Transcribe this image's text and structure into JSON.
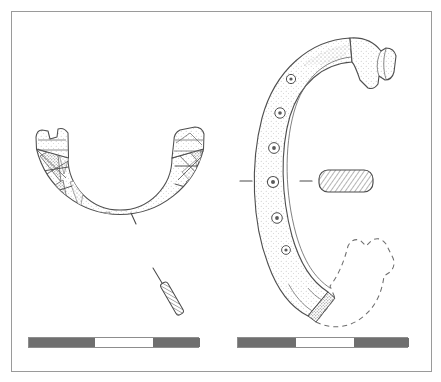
{
  "figure": {
    "domain_kind": "archaeological-line-drawing",
    "title": "Decorated penannular bracelet — plan and profile views",
    "background_color": "#ffffff",
    "frame": {
      "border_color": "#9a9a9a",
      "x": 11,
      "y": 11,
      "width": 421,
      "height": 361
    },
    "ink_color": "#555555",
    "stipple_color": "#6a6a6a",
    "views": [
      {
        "id": "view-plan",
        "name": "plan-view",
        "label": "Plan view of penannular bracelet",
        "description": "U-shaped open bracelet seen from above, with panelled stippled triangular decoration and broken terminals",
        "center_x": 120,
        "center_y": 215,
        "outer_radius": 86,
        "inner_radius": 52,
        "open_gap_deg": 150,
        "panel_count": 13
      },
      {
        "id": "view-profile",
        "name": "profile-view",
        "label": "Profile view of penannular bracelet",
        "description": "C-shaped side view with ring-and-dot bosses along the band, flared upper terminal and dashed reconstruction of the lost lower terminal",
        "center_x": 330,
        "center_y": 178,
        "outer_radius": 150,
        "inner_radius": 112,
        "boss_count": 5
      }
    ],
    "annotations": [
      {
        "id": "section-line-plan",
        "name": "section-line-plan",
        "label": "Section indicator line on plan view",
        "kind": "leader-tick"
      },
      {
        "id": "section-profile-small",
        "name": "section-profile-small",
        "label": "Hatched narrow bar section of band (plan view)",
        "kind": "hatched-section"
      },
      {
        "id": "section-line-profile",
        "name": "section-line-profile",
        "label": "Section line tick marks across profile view",
        "kind": "section-tick-pair"
      },
      {
        "id": "section-rect",
        "name": "cross-section-rectangle",
        "label": "Hatched rounded-rectangle cross-section of band",
        "kind": "hatched-section"
      },
      {
        "id": "reconstruction-dashed",
        "name": "reconstruction-outline",
        "label": "Dashed reconstruction of missing terminal",
        "kind": "dashed-outline"
      }
    ],
    "scalebars": [
      {
        "id": "scalebar-left",
        "name": "scale-bar-plan",
        "label": "Scale bar for plan view",
        "segments": [
          {
            "tone": "dark",
            "width_px": 66
          },
          {
            "tone": "light",
            "width_px": 58
          },
          {
            "tone": "dark",
            "width_px": 47
          }
        ],
        "dark_color": "#6f6f6f",
        "light_color": "#ffffff",
        "border_color": "#8d8d8d"
      },
      {
        "id": "scalebar-right",
        "name": "scale-bar-profile",
        "label": "Scale bar for profile view",
        "segments": [
          {
            "tone": "dark",
            "width_px": 58
          },
          {
            "tone": "light",
            "width_px": 58
          },
          {
            "tone": "dark",
            "width_px": 55
          }
        ],
        "dark_color": "#6f6f6f",
        "light_color": "#ffffff",
        "border_color": "#8d8d8d"
      }
    ]
  }
}
